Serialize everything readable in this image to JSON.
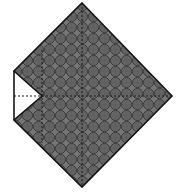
{
  "figure": {
    "canvas": {
      "width": 183,
      "height": 195
    },
    "background_color": "#ffffff",
    "shape": {
      "name": "notched-rhombus",
      "outline_color": "#141414",
      "outline_width": 1.6,
      "fill_base_color": "#6b6b6b",
      "vertices": [
        {
          "label": "top",
          "x": 82,
          "y": 3
        },
        {
          "label": "right",
          "x": 172,
          "y": 96
        },
        {
          "label": "bottom",
          "x": 82,
          "y": 187
        },
        {
          "label": "notch-lower-left",
          "x": 14,
          "y": 120
        },
        {
          "label": "notch-apex",
          "x": 42,
          "y": 96
        },
        {
          "label": "notch-upper-left",
          "x": 14,
          "y": 71
        }
      ]
    },
    "texture": {
      "name": "overlapping-circles-scale-pattern",
      "cell_size": 11,
      "circle_radius": 5.1,
      "stroke_color": "#3a3a3a",
      "stroke_width": 1.0,
      "light_color": "#7d7d7d",
      "dark_color": "#5b5b5b"
    },
    "construction_lines": [
      {
        "name": "horizontal-axis",
        "orientation": "horizontal",
        "y": 96,
        "x1": 14,
        "x2": 172,
        "style": "dashed",
        "color": "#1a1a1a",
        "dash": "2,2"
      },
      {
        "name": "vertical-center-axis",
        "orientation": "vertical",
        "x": 82,
        "y1": 3,
        "y2": 187,
        "style": "dashed",
        "color": "#1a1a1a",
        "dash": "2,2"
      },
      {
        "name": "vertical-left-axis",
        "orientation": "vertical",
        "x": 42,
        "y1": 50,
        "y2": 143,
        "style": "dashed",
        "color": "#1a1a1a",
        "dash": "2,2"
      }
    ],
    "notch": {
      "name": "v-notch",
      "side": "left",
      "fill_color": "#ffffff",
      "apex_x": 42,
      "apex_y": 96,
      "opening_top_y": 71,
      "opening_bottom_y": 120,
      "opening_x": 14
    }
  }
}
